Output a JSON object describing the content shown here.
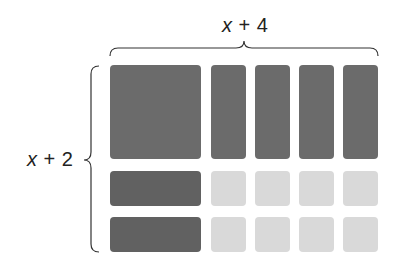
{
  "diagram": {
    "type": "algebra-tiles-area-model",
    "top_label": {
      "var": "x",
      "rest": " + 4"
    },
    "side_label": {
      "var": "x",
      "rest": " + 2"
    },
    "colors": {
      "x_squared": "#6b6b6b",
      "x_tile": "#6b6b6b",
      "x_tile_horizontal": "#616161",
      "unit_tile": "#d9d9d9",
      "brace": "#333333"
    },
    "tiles": {
      "x_squared": [
        {
          "x": 110,
          "y": 65,
          "w": 91,
          "h": 94
        }
      ],
      "x_vertical": [
        {
          "x": 211,
          "y": 65,
          "w": 35,
          "h": 94
        },
        {
          "x": 255,
          "y": 65,
          "w": 35,
          "h": 94
        },
        {
          "x": 299,
          "y": 65,
          "w": 35,
          "h": 94
        },
        {
          "x": 343,
          "y": 65,
          "w": 35,
          "h": 94
        }
      ],
      "x_horizontal": [
        {
          "x": 110,
          "y": 171,
          "w": 91,
          "h": 35
        },
        {
          "x": 110,
          "y": 217,
          "w": 91,
          "h": 35
        }
      ],
      "units": [
        {
          "x": 211,
          "y": 171,
          "w": 35,
          "h": 35
        },
        {
          "x": 255,
          "y": 171,
          "w": 35,
          "h": 35
        },
        {
          "x": 299,
          "y": 171,
          "w": 35,
          "h": 35
        },
        {
          "x": 343,
          "y": 171,
          "w": 35,
          "h": 35
        },
        {
          "x": 211,
          "y": 217,
          "w": 35,
          "h": 35
        },
        {
          "x": 255,
          "y": 217,
          "w": 35,
          "h": 35
        },
        {
          "x": 299,
          "y": 217,
          "w": 35,
          "h": 35
        },
        {
          "x": 343,
          "y": 217,
          "w": 35,
          "h": 35
        }
      ]
    },
    "counts": {
      "x_squared": 1,
      "x_tiles": 6,
      "unit_tiles": 8
    }
  }
}
